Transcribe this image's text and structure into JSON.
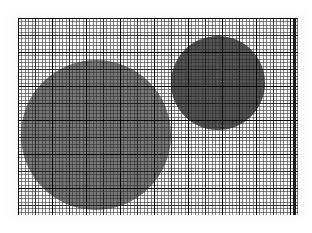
{
  "figure": {
    "background_color": "#fcfcfc",
    "paper_color": "#f7f7f7",
    "width": 312,
    "height": 233
  },
  "plot_area": {
    "name": "graph-paper-field",
    "x": 18,
    "y": 18,
    "width": 280,
    "height": 197
  },
  "grid": {
    "minor_spacing_px": 3.4,
    "mid_spacing_px": 17,
    "major_spacing_px": 34,
    "minor_color": "#282828",
    "mid_color": "#141414",
    "major_color": "#000000",
    "visible": true
  },
  "annotations": {
    "vertical_rule": {
      "label": "heavy-vertical-rule",
      "x": 275,
      "width": 3,
      "color": "#1a1a1a"
    }
  },
  "chart_data": {
    "type": "scatter",
    "title": "",
    "xlabel": "",
    "ylabel": "",
    "grid": true,
    "legend_position": "none",
    "xlim": [
      0,
      280
    ],
    "ylim": [
      0,
      197
    ],
    "units": "pixels",
    "series": [
      {
        "name": "large-disc",
        "marker": "circle",
        "color": "#787878",
        "points": [
          {
            "cx": 78,
            "cy": 117,
            "r": 75,
            "fill": "#787878"
          }
        ]
      },
      {
        "name": "small-disc",
        "marker": "circle",
        "color": "#555555",
        "points": [
          {
            "cx": 200,
            "cy": 65,
            "r": 47,
            "fill": "#555555"
          }
        ]
      }
    ]
  },
  "shapes": [
    {
      "id": "large-disc",
      "label": "large-gray-circle",
      "cx": 78,
      "cy": 117,
      "r": 75,
      "fill": "#787878"
    },
    {
      "id": "small-disc",
      "label": "small-dark-circle",
      "cx": 200,
      "cy": 65,
      "r": 47,
      "fill": "#555555"
    }
  ]
}
